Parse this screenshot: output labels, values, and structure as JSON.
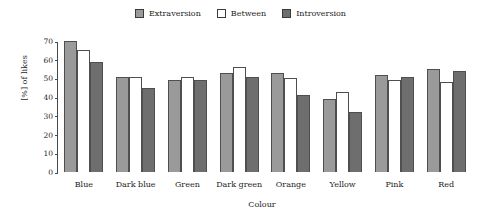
{
  "chart_data": {
    "type": "bar",
    "title": "",
    "xlabel": "Colour",
    "ylabel": "[%] of likes",
    "categories": [
      "Blue",
      "Dark blue",
      "Green",
      "Dark green",
      "Orange",
      "Yellow",
      "Pink",
      "Red"
    ],
    "series": [
      {
        "name": "Extraversion",
        "color": "#9a9a9a",
        "values": [
          70,
          51,
          49,
          53,
          53,
          39,
          52,
          55
        ]
      },
      {
        "name": "Between",
        "color": "#ffffff",
        "values": [
          65,
          51,
          51,
          56,
          50,
          43,
          49,
          48
        ]
      },
      {
        "name": "Introversion",
        "color": "#6e6e6e",
        "values": [
          59,
          45,
          49,
          51,
          41,
          32,
          51,
          54
        ]
      }
    ],
    "ylim": [
      0,
      70
    ],
    "yticks": [
      70,
      60,
      50,
      40,
      30,
      20,
      10,
      0
    ],
    "grid": false,
    "legend_position": "top-center",
    "bar_outline_color": "#4f4f4f",
    "axis_color": "#4a4a4a",
    "background_color": "#ffffff"
  }
}
